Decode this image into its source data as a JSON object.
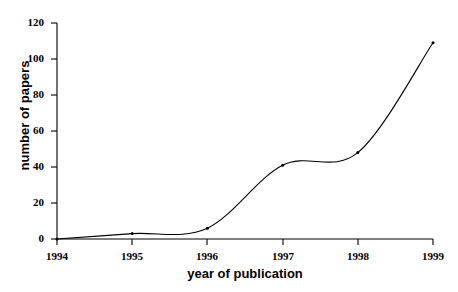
{
  "chart_data": {
    "type": "line",
    "title": "",
    "xlabel": "year of publication",
    "ylabel": "number of papers",
    "x": [
      1994,
      1995,
      1996,
      1997,
      1998,
      1999
    ],
    "values": [
      0,
      3,
      6,
      41,
      48,
      109
    ],
    "categories": [
      "1994",
      "1995",
      "1996",
      "1997",
      "1998",
      "1999"
    ],
    "series": [
      {
        "name": "number of papers",
        "values": [
          0,
          3,
          6,
          41,
          48,
          109
        ]
      }
    ],
    "xlim": [
      1994,
      1999
    ],
    "ylim": [
      0,
      120
    ],
    "xticks": [
      "1994",
      "1995",
      "1996",
      "1997",
      "1998",
      "1999"
    ],
    "yticks": [
      "0",
      "20",
      "40",
      "60",
      "80",
      "100",
      "120"
    ],
    "grid": false,
    "legend": false,
    "legend_position": "none",
    "line_color": "#000000",
    "marker": "point",
    "marker_color": "#000000",
    "smoothing": "spline",
    "background_color": "#ffffff",
    "axis_color": "#000000"
  },
  "axes": {
    "y_title": "number of papers",
    "x_title": "year of publication",
    "y_ticks": [
      {
        "label": "120",
        "value": 120
      },
      {
        "label": "100",
        "value": 100
      },
      {
        "label": "80",
        "value": 80
      },
      {
        "label": "60",
        "value": 60
      },
      {
        "label": "40",
        "value": 40
      },
      {
        "label": "20",
        "value": 20
      },
      {
        "label": "0",
        "value": 0
      }
    ],
    "x_ticks": [
      {
        "label": "1994",
        "value": 1994
      },
      {
        "label": "1995",
        "value": 1995
      },
      {
        "label": "1996",
        "value": 1996
      },
      {
        "label": "1997",
        "value": 1997
      },
      {
        "label": "1998",
        "value": 1998
      },
      {
        "label": "1999",
        "value": 1999
      }
    ]
  }
}
